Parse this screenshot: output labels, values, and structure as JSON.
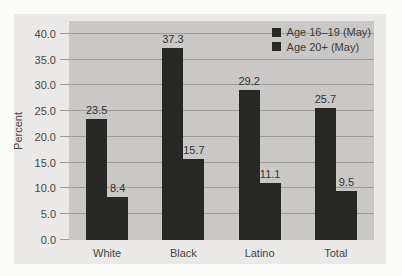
{
  "chart_data": {
    "type": "bar",
    "categories": [
      "White",
      "Black",
      "Latino",
      "Total"
    ],
    "series": [
      {
        "name": "Age 16–19 (May)",
        "values": [
          23.5,
          37.3,
          29.2,
          25.7
        ]
      },
      {
        "name": "Age 20+ (May)",
        "values": [
          8.4,
          15.7,
          11.1,
          9.5
        ]
      }
    ],
    "title": "",
    "xlabel": "",
    "ylabel": "Percent",
    "ylim": [
      0,
      42.5
    ],
    "yticks": [
      "0.0",
      "5.0",
      "10.0",
      "15.0",
      "20.0",
      "25.0",
      "30.0",
      "35.0",
      "40.0"
    ],
    "ytick_values": [
      0,
      5,
      10,
      15,
      20,
      25,
      30,
      35,
      40
    ],
    "grid": true,
    "legend_position": "top-right",
    "value_labels_shown": true,
    "colors": {
      "bar": "#272726",
      "plot_background": "#c9c8c6",
      "figure_background": "#eae9e7",
      "gridline": "#9d9c9a",
      "text": "#454545"
    }
  }
}
